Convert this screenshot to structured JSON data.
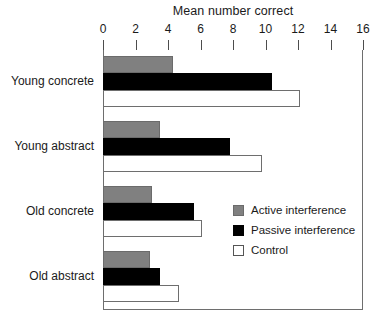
{
  "chart_data": {
    "type": "bar",
    "orientation": "horizontal",
    "title": "Mean number correct",
    "xlabel": "",
    "ylabel": "",
    "xlim": [
      0,
      16
    ],
    "xticks": [
      0,
      2,
      4,
      6,
      8,
      10,
      12,
      14,
      16
    ],
    "grid": false,
    "legend_position": "center-right-inside",
    "categories": [
      "Young concrete",
      "Young abstract",
      "Old concrete",
      "Old abstract"
    ],
    "series": [
      {
        "name": "Active interference",
        "color": "#808080",
        "values": [
          4.3,
          3.5,
          3.0,
          2.9
        ]
      },
      {
        "name": "Passive interference",
        "color": "#000000",
        "values": [
          10.4,
          7.8,
          5.6,
          3.5
        ]
      },
      {
        "name": "Control",
        "color": "#ffffff",
        "values": [
          12.1,
          9.8,
          6.1,
          4.7
        ]
      }
    ]
  },
  "legend": {
    "items": [
      {
        "label": "Active interference",
        "swatch": "active"
      },
      {
        "label": "Passive interference",
        "swatch": "passive"
      },
      {
        "label": "Control",
        "swatch": "control"
      }
    ]
  }
}
